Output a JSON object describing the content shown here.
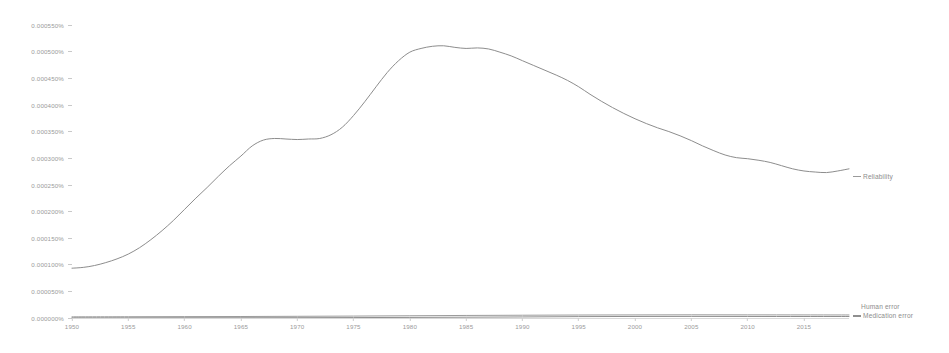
{
  "chart_data": {
    "type": "line",
    "title": "",
    "xlabel": "",
    "ylabel": "",
    "xlim": [
      1950,
      2019
    ],
    "ylim": [
      0.0,
      0.00055
    ],
    "grid": false,
    "legend_position": "right-inline-end-labels",
    "x_tick_labels": [
      "1950",
      "1955",
      "1960",
      "1965",
      "1970",
      "1975",
      "1980",
      "1985",
      "1990",
      "1995",
      "2000",
      "2005",
      "2010",
      "2015"
    ],
    "x_tick_values": [
      1950,
      1955,
      1960,
      1965,
      1970,
      1975,
      1980,
      1985,
      1990,
      1995,
      2000,
      2005,
      2010,
      2015
    ],
    "y_tick_labels": [
      "0.000000%",
      "0.000050%",
      "0.000100%",
      "0.000150%",
      "0.000200%",
      "0.000250%",
      "0.000300%",
      "0.000350%",
      "0.000400%",
      "0.000450%",
      "0.000500%",
      "0.000550%"
    ],
    "y_tick_values": [
      0.0,
      5e-05,
      0.0001,
      0.00015,
      0.0002,
      0.00025,
      0.0003,
      0.00035,
      0.0004,
      0.00045,
      0.0005,
      0.00055
    ],
    "series": [
      {
        "name": "Reliability",
        "color": "#8d8d8d",
        "x": [
          1950,
          1951,
          1952,
          1953,
          1954,
          1955,
          1956,
          1957,
          1958,
          1959,
          1960,
          1961,
          1962,
          1963,
          1964,
          1965,
          1966,
          1967,
          1968,
          1969,
          1970,
          1971,
          1972,
          1973,
          1974,
          1975,
          1976,
          1977,
          1978,
          1979,
          1980,
          1981,
          1982,
          1983,
          1984,
          1985,
          1986,
          1987,
          1988,
          1989,
          1990,
          1991,
          1992,
          1993,
          1994,
          1995,
          1996,
          1997,
          1998,
          1999,
          2000,
          2001,
          2002,
          2003,
          2004,
          2005,
          2006,
          2007,
          2008,
          2009,
          2010,
          2011,
          2012,
          2013,
          2014,
          2015,
          2016,
          2017,
          2018,
          2019
        ],
        "values": [
          9.35e-05,
          9.5e-05,
          9.85e-05,
          0.000104,
          0.000111,
          0.00012,
          0.000132,
          0.000147,
          0.000164,
          0.000183,
          0.000204,
          0.000225,
          0.000245,
          0.000266,
          0.000286,
          0.000304,
          0.000323,
          0.000334,
          0.000337,
          0.000336,
          0.000335,
          0.000336,
          0.000337,
          0.000344,
          0.000358,
          0.00038,
          0.000406,
          0.000434,
          0.000461,
          0.000483,
          0.000499,
          0.000506,
          0.00051,
          0.000511,
          0.000508,
          0.000506,
          0.000507,
          0.000505,
          0.000499,
          0.000492,
          0.000483,
          0.000474,
          0.000465,
          0.000456,
          0.000446,
          0.000434,
          0.00042,
          0.000407,
          0.000395,
          0.000384,
          0.000374,
          0.000365,
          0.000357,
          0.00035,
          0.000342,
          0.000333,
          0.000323,
          0.000314,
          0.000306,
          0.000301,
          0.000299,
          0.000296,
          0.000292,
          0.000286,
          0.00028,
          0.000276,
          0.000274,
          0.000273,
          0.000276,
          0.00028
        ]
      },
      {
        "name": "Human error",
        "color": "#9b9b9b",
        "x": [
          1950,
          1955,
          1960,
          1965,
          1970,
          1975,
          1980,
          1985,
          1990,
          1995,
          2000,
          2005,
          2010,
          2015,
          2019
        ],
        "values": [
          2.2e-06,
          2.4e-06,
          2.6e-06,
          2.8e-06,
          3.2e-06,
          3.6e-06,
          4.2e-06,
          4.8e-06,
          5.2e-06,
          5.6e-06,
          5.8e-06,
          6e-06,
          5.9e-06,
          5.8e-06,
          5.7e-06
        ]
      },
      {
        "name": "Medication error",
        "color": "#8f8f8f",
        "x": [
          1950,
          1955,
          1960,
          1965,
          1970,
          1975,
          1980,
          1985,
          1990,
          1995,
          2000,
          2005,
          2010,
          2015,
          2019
        ],
        "values": [
          4e-07,
          4e-07,
          5e-07,
          5e-07,
          6e-07,
          8e-07,
          1.1e-06,
          1.5e-06,
          2e-06,
          2.6e-06,
          2.9e-06,
          3e-06,
          2.9e-06,
          2.8e-06,
          2.8e-06
        ]
      }
    ]
  },
  "labels": {
    "reliability": "Reliability",
    "human_error": "Human error",
    "medication_error": "Medication error"
  }
}
